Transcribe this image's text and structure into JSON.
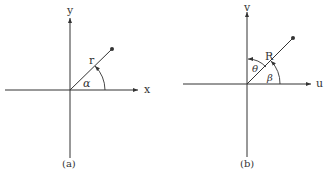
{
  "panels": [
    {
      "id": "a",
      "caption": "(a)",
      "x_axis_label": "x",
      "y_axis_label": "y",
      "radius_label": "r",
      "angle_label": "α"
    },
    {
      "id": "b",
      "caption": "(b)",
      "x_axis_label": "u",
      "y_axis_label": "v",
      "radius_label": "R",
      "angle_from_x_label": "β",
      "angle_from_y_label": "θ"
    }
  ],
  "colors": {
    "line": "#333333",
    "background": "#ffffff"
  }
}
